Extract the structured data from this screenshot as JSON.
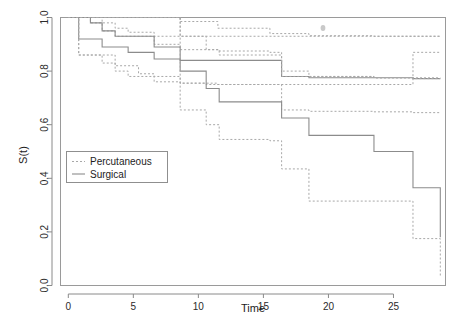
{
  "chart_data": {
    "type": "line",
    "title": "",
    "xlabel": "Time",
    "ylabel": "S(t)",
    "xlim": [
      -0.6,
      29.0
    ],
    "ylim": [
      0.0,
      1.0
    ],
    "grid": false,
    "legend_position": "center-left",
    "xticks": [
      0,
      5,
      10,
      15,
      20,
      25
    ],
    "xtick_labels": [
      "0",
      "5",
      "10",
      "15",
      "20",
      "25"
    ],
    "yticks": [
      0.0,
      0.2,
      0.4,
      0.6,
      0.8,
      1.0
    ],
    "ytick_labels": [
      "0.0",
      "0.2",
      "0.4",
      "0.6",
      "0.8",
      "1.0"
    ],
    "step_style": "post",
    "series": [
      {
        "name": "Percutaneous",
        "line_style": "dashed",
        "color": "#a8a8a8",
        "role": "estimate",
        "x": [
          0.0,
          0.8,
          1.7,
          2.6,
          3.6,
          5.4,
          6.6,
          8.6,
          11.5,
          15.5,
          16.4,
          18.5,
          23.5,
          26.5,
          28.6
        ],
        "y": [
          1.0,
          1.0,
          0.98,
          0.95,
          0.93,
          0.93,
          0.93,
          0.93,
          0.93,
          0.93,
          0.93,
          0.93,
          0.93,
          0.93,
          0.93
        ]
      },
      {
        "name": "Surgical",
        "line_style": "solid",
        "color": "#8c8c8c",
        "role": "estimate",
        "x": [
          0.0,
          0.8,
          1.7,
          2.6,
          3.6,
          4.6,
          5.6,
          6.6,
          8.6,
          10.6,
          11.6,
          15.5,
          16.4,
          18.5,
          23.5,
          26.5,
          28.6
        ],
        "y": [
          1.0,
          0.92,
          0.92,
          0.89,
          0.89,
          0.87,
          0.87,
          0.845,
          0.84,
          0.84,
          0.84,
          0.84,
          0.78,
          0.775,
          0.775,
          0.772,
          0.772
        ]
      },
      {
        "name": "Percutaneous upper CI",
        "line_style": "dashed",
        "color": "#a8a8a8",
        "role": "ci-upper",
        "x": [
          0.0,
          1.7,
          2.6,
          3.6,
          5.4,
          6.6,
          8.6,
          11.5,
          15.5,
          18.5,
          23.5,
          26.5,
          28.6
        ],
        "y": [
          1.0,
          1.0,
          1.0,
          1.0,
          1.0,
          1.0,
          0.985,
          0.96,
          0.94,
          0.932,
          0.93,
          0.93,
          0.93
        ]
      },
      {
        "name": "Percutaneous lower CI",
        "line_style": "dashed",
        "color": "#a8a8a8",
        "role": "ci-lower",
        "x": [
          0.0,
          0.8,
          2.6,
          3.6,
          5.4,
          6.6,
          8.6,
          11.5,
          15.5,
          18.5,
          23.5,
          26.5,
          28.6
        ],
        "y": [
          1.0,
          0.86,
          0.86,
          0.82,
          0.79,
          0.78,
          0.755,
          0.75,
          0.75,
          0.75,
          0.75,
          0.87,
          0.87
        ]
      },
      {
        "name": "Surgical upper CI",
        "line_style": "dashed",
        "color": "#a8a8a8",
        "role": "ci-upper",
        "x": [
          0.0,
          0.8,
          2.6,
          3.6,
          4.6,
          6.6,
          8.6,
          11.6,
          15.5,
          16.4,
          18.5,
          23.5,
          26.5,
          28.6
        ],
        "y": [
          1.0,
          1.0,
          0.98,
          0.96,
          0.945,
          0.9,
          0.88,
          0.875,
          0.87,
          0.8,
          0.78,
          0.775,
          0.772,
          0.772
        ]
      },
      {
        "name": "Surgical lower CI",
        "line_style": "dashed",
        "color": "#a8a8a8",
        "role": "ci-lower",
        "x": [
          0.0,
          0.8,
          2.6,
          3.6,
          4.6,
          6.6,
          8.6,
          10.6,
          11.6,
          15.5,
          16.4,
          18.5,
          23.5,
          26.5,
          28.6
        ],
        "y": [
          1.0,
          0.86,
          0.83,
          0.8,
          0.78,
          0.76,
          0.755,
          0.75,
          0.75,
          0.75,
          0.655,
          0.65,
          0.648,
          0.645,
          0.645
        ]
      },
      {
        "name": "Surgical lower group",
        "line_style": "solid",
        "color": "#8c8c8c",
        "role": "estimate-lower-group",
        "x": [
          0.0,
          0.8,
          1.7,
          2.6,
          3.6,
          5.6,
          6.6,
          8.6,
          10.6,
          11.6,
          15.5,
          16.4,
          18.5,
          23.5,
          26.5,
          28.6
        ],
        "y": [
          1.0,
          1.0,
          0.98,
          0.95,
          0.93,
          0.93,
          0.89,
          0.8,
          0.735,
          0.685,
          0.685,
          0.625,
          0.56,
          0.5,
          0.365,
          0.18
        ]
      },
      {
        "name": "Lower group upper CI",
        "line_style": "dashed",
        "color": "#a8a8a8",
        "role": "ci-upper-lower-group",
        "x": [
          0.0,
          8.6,
          10.6,
          11.6,
          15.5,
          16.4,
          18.5,
          23.5,
          26.5,
          28.6
        ],
        "y": [
          1.0,
          0.93,
          0.88,
          0.86,
          0.86,
          0.78,
          0.78,
          0.775,
          0.775,
          0.775
        ]
      },
      {
        "name": "Lower group lower CI",
        "line_style": "dashed",
        "color": "#a8a8a8",
        "role": "ci-lower-lower-group",
        "x": [
          0.0,
          8.6,
          10.6,
          11.6,
          13.0,
          15.5,
          16.4,
          18.5,
          23.5,
          26.5,
          28.6
        ],
        "y": [
          1.0,
          0.655,
          0.6,
          0.545,
          0.545,
          0.54,
          0.435,
          0.315,
          0.315,
          0.175,
          0.03
        ]
      }
    ]
  },
  "legend": {
    "entries": [
      {
        "label": "Percutaneous",
        "style": "dashed"
      },
      {
        "label": "Surgical",
        "style": "solid"
      }
    ]
  },
  "axes": {
    "x_title": "Time",
    "y_title": "S(t)"
  }
}
